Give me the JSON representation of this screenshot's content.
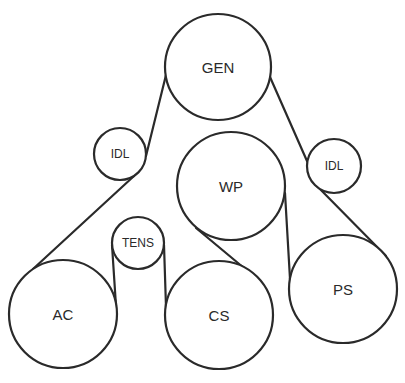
{
  "diagram": {
    "width": 405,
    "height": 383,
    "stroke_color": "#2a2a2a",
    "background": "#ffffff",
    "pulleys": [
      {
        "id": "gen",
        "label": "GEN",
        "cx": 218,
        "cy": 67,
        "r": 53,
        "font_size": 15
      },
      {
        "id": "idl-left",
        "label": "IDL",
        "cx": 120,
        "cy": 154,
        "r": 26,
        "font_size": 12
      },
      {
        "id": "wp",
        "label": "WP",
        "cx": 231,
        "cy": 186,
        "r": 54,
        "font_size": 15
      },
      {
        "id": "idl-right",
        "label": "IDL",
        "cx": 334,
        "cy": 166,
        "r": 27,
        "font_size": 12
      },
      {
        "id": "tens",
        "label": "TENS",
        "cx": 138,
        "cy": 243,
        "r": 26,
        "font_size": 12
      },
      {
        "id": "ac",
        "label": "AC",
        "cx": 63,
        "cy": 314,
        "r": 54,
        "font_size": 15
      },
      {
        "id": "cs",
        "label": "CS",
        "cx": 219,
        "cy": 315,
        "r": 54,
        "font_size": 15
      },
      {
        "id": "ps",
        "label": "PS",
        "cx": 343,
        "cy": 289,
        "r": 54,
        "font_size": 15
      }
    ],
    "belt_segments": [
      {
        "from": [
          166,
          75
        ],
        "to": [
          146,
          156
        ]
      },
      {
        "from": [
          134,
          176
        ],
        "to": [
          33,
          269
        ]
      },
      {
        "from": [
          116,
          306
        ],
        "to": [
          112,
          245
        ]
      },
      {
        "from": [
          164,
          245
        ],
        "to": [
          166,
          307
        ]
      },
      {
        "from": [
          262,
          283
        ],
        "to": [
          196,
          228
        ]
      },
      {
        "from": [
          285,
          193
        ],
        "to": [
          290,
          279
        ]
      },
      {
        "from": [
          386,
          256
        ],
        "to": [
          315,
          184
        ]
      },
      {
        "from": [
          307,
          161
        ],
        "to": [
          270,
          77
        ]
      }
    ]
  }
}
